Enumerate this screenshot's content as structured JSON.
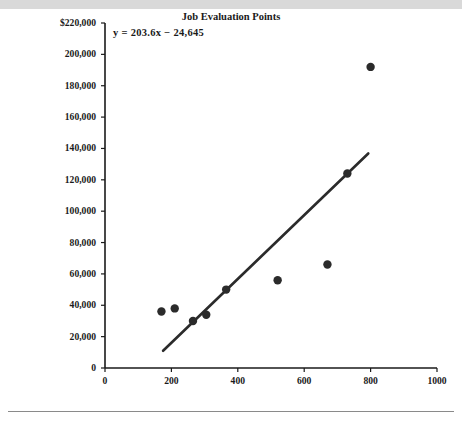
{
  "figure": {
    "equation_text": "y = 203.6x − 24,645",
    "top_band_color": "#d9d9d9",
    "marker_color": "#2b2b2b",
    "line_color": "#2b2b2b",
    "axis_color": "#1a1a1a"
  },
  "chart_data": {
    "type": "scatter",
    "title": "",
    "xlabel": "Job Evaluation Points",
    "ylabel": "Dollars",
    "xlim": [
      0,
      1000
    ],
    "ylim": [
      0,
      220000
    ],
    "grid": false,
    "legend": null,
    "x_ticks": [
      0,
      200,
      400,
      600,
      800,
      1000
    ],
    "x_tick_labels": [
      "0",
      "200",
      "400",
      "600",
      "800",
      "1000"
    ],
    "y_ticks": [
      0,
      20000,
      40000,
      60000,
      80000,
      100000,
      120000,
      140000,
      160000,
      180000,
      200000,
      220000
    ],
    "y_tick_labels": [
      "0",
      "20,000",
      "40,000",
      "60,000",
      "80,000",
      "100,000",
      "120,000",
      "140,000",
      "160,000",
      "180,000",
      "200,000",
      "$220,000"
    ],
    "points": [
      {
        "x": 170,
        "y": 36000
      },
      {
        "x": 210,
        "y": 38000
      },
      {
        "x": 265,
        "y": 30000
      },
      {
        "x": 305,
        "y": 34000
      },
      {
        "x": 365,
        "y": 50000
      },
      {
        "x": 520,
        "y": 56000
      },
      {
        "x": 670,
        "y": 66000
      },
      {
        "x": 730,
        "y": 124000
      },
      {
        "x": 800,
        "y": 192000
      }
    ],
    "trendline": {
      "equation": "y = 203.6x − 24,645",
      "slope": 203.6,
      "intercept": -24645,
      "x_start": 175,
      "x_end": 793
    },
    "annotations": [
      {
        "text": "y = 203.6x − 24,645",
        "x": 200,
        "y": 211000
      }
    ]
  }
}
